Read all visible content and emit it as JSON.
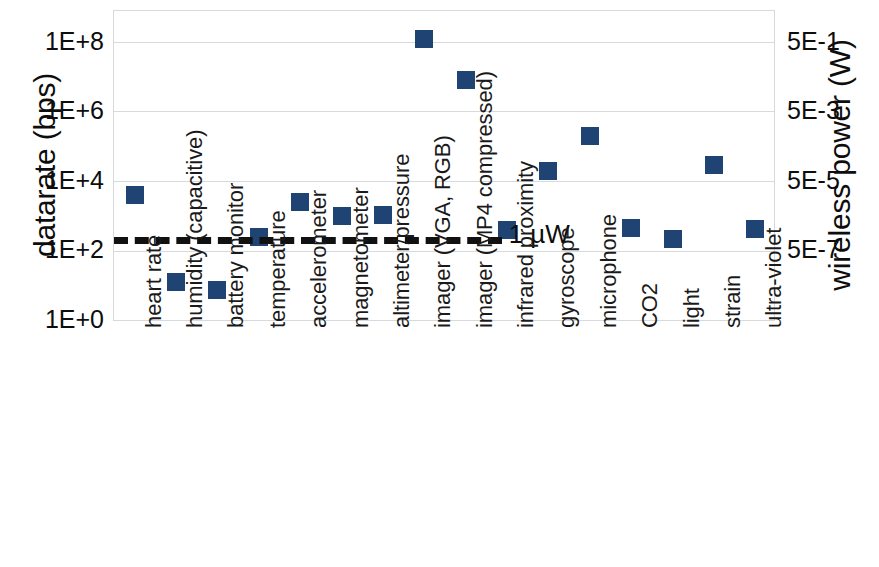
{
  "chart_data": {
    "type": "scatter",
    "title": "",
    "xlabel": "sensor",
    "ylabel": "datarate (bps)",
    "y2label": "wireless power (W)",
    "categories": [
      "heart rate",
      "humidity (capacitive)",
      "battery monitor",
      "temperature",
      "accelerometer",
      "magnetometer",
      "altimeter/pressure",
      "imager (VGA, RGB)",
      "imager (MP4 compressed)",
      "infrared proximity",
      "gyroscope",
      "microphone",
      "CO2",
      "light",
      "strain",
      "ultra-violet"
    ],
    "values": [
      4000,
      13,
      8,
      250,
      2500,
      1000,
      1100,
      120000000,
      8000000,
      420,
      20000,
      200000,
      450,
      230,
      30000,
      430
    ],
    "yticks": [
      "1E+0",
      "1E+2",
      "1E+4",
      "1E+6",
      "1E+8"
    ],
    "ytick_values": [
      1,
      100,
      10000,
      1000000,
      100000000
    ],
    "y2ticks": [
      "5E-7",
      "5E-5",
      "5E-3",
      "5E-1"
    ],
    "y2tick_values": [
      5e-07,
      5e-05,
      0.005,
      0.5
    ],
    "ylim": [
      1,
      100000000
    ],
    "grid": true,
    "legend": "none",
    "annotations": [
      {
        "label": "1 µW",
        "type": "threshold-line",
        "style": "dashed",
        "value": 260
      }
    ],
    "marker_color": "#1f4372",
    "grid_color": "#d6d9dd",
    "annotation_color": "#111111"
  },
  "axes": {
    "y_left_title": "datarate (bps)",
    "y_right_title": "wireless power (W)",
    "x_title": "sensor"
  },
  "threshold": {
    "label": "1 µW"
  }
}
